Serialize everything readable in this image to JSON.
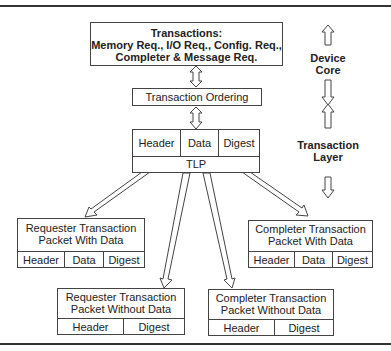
{
  "transactions_box": {
    "title": "Transactions:",
    "line1": "Memory Req., I/O Req., Config. Req.,",
    "line2": "Completer & Message Req."
  },
  "ordering_box": {
    "label": "Transaction Ordering"
  },
  "tlp_box": {
    "fields": [
      "Header",
      "Data",
      "Digest"
    ],
    "label": "TLP"
  },
  "side_labels": {
    "device_core": [
      "Device",
      "Core"
    ],
    "transaction_layer": [
      "Transaction",
      "Layer"
    ]
  },
  "packets": {
    "requester_with_data": {
      "line1": "Requester Transaction",
      "line2": "Packet With Data",
      "fields": [
        "Header",
        "Data",
        "Digest"
      ]
    },
    "completer_with_data": {
      "line1": "Completer Transaction",
      "line2": "Packet With Data",
      "fields": [
        "Header",
        "Data",
        "Digest"
      ]
    },
    "requester_without_data": {
      "line1": "Requester Transaction",
      "line2": "Packet Without Data",
      "fields": [
        "Header",
        "Digest"
      ]
    },
    "completer_without_data": {
      "line1": "Completer Transaction",
      "line2": "Packet Without Data",
      "fields": [
        "Header",
        "Digest"
      ]
    }
  }
}
